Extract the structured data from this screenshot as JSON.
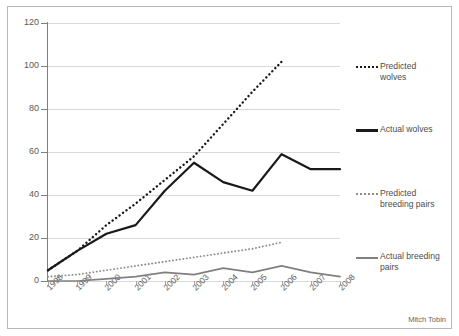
{
  "credit": "Mitch Tobin",
  "axes": {
    "y_ticks": [
      "0",
      "20",
      "40",
      "60",
      "80",
      "100",
      "120"
    ],
    "x_ticks": [
      "1998",
      "1999",
      "2000",
      "2001",
      "2002",
      "2003",
      "2004",
      "2005",
      "2006",
      "2007",
      "2008"
    ]
  },
  "legend": {
    "items": [
      {
        "label": "Predicted wolves",
        "style": "dotted",
        "color": "#1a1a1a"
      },
      {
        "label": "Actual wolves",
        "style": "solid",
        "color": "#1a1a1a"
      },
      {
        "label": "Predicted breeding pairs",
        "style": "dotted",
        "color": "#8c8c8c"
      },
      {
        "label": "Actual breeding pairs",
        "style": "solid",
        "color": "#808080"
      }
    ]
  },
  "chart_data": {
    "type": "line",
    "title": "",
    "xlabel": "",
    "ylabel": "",
    "ylim": [
      0,
      120
    ],
    "ytick_step": 20,
    "grid": true,
    "legend_position": "right",
    "x": [
      1998,
      1999,
      2000,
      2001,
      2002,
      2003,
      2004,
      2005,
      2006,
      2007,
      2008
    ],
    "series": [
      {
        "name": "Predicted wolves",
        "style": "dotted",
        "color": "#1a1a1a",
        "x": [
          1998,
          1999,
          2000,
          2001,
          2002,
          2003,
          2004,
          2005,
          2006
        ],
        "values": [
          5,
          14,
          26,
          36,
          47,
          58,
          73,
          88,
          102
        ]
      },
      {
        "name": "Actual wolves",
        "style": "solid",
        "color": "#1a1a1a",
        "x": [
          1998,
          1999,
          2000,
          2001,
          2002,
          2003,
          2004,
          2005,
          2006,
          2007,
          2008
        ],
        "values": [
          5,
          14,
          22,
          26,
          42,
          55,
          46,
          42,
          59,
          52,
          52
        ]
      },
      {
        "name": "Predicted breeding pairs",
        "style": "dotted",
        "color": "#8c8c8c",
        "x": [
          1998,
          1999,
          2000,
          2001,
          2002,
          2003,
          2004,
          2005,
          2006
        ],
        "values": [
          2,
          3,
          5,
          7,
          9,
          11,
          13,
          15,
          18
        ]
      },
      {
        "name": "Actual breeding pairs",
        "style": "solid",
        "color": "#808080",
        "x": [
          1998,
          1999,
          2000,
          2001,
          2002,
          2003,
          2004,
          2005,
          2006,
          2007,
          2008
        ],
        "values": [
          0,
          0,
          1,
          2,
          4,
          3,
          6,
          4,
          7,
          4,
          2
        ]
      }
    ]
  }
}
